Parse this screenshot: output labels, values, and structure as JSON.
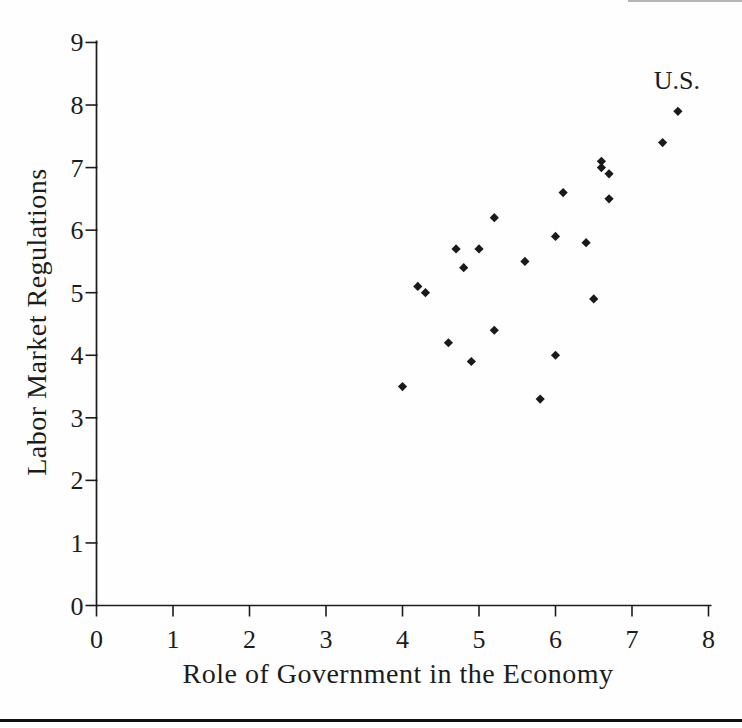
{
  "figure": {
    "background": "#fefefe",
    "ink_color": "#1c1c1c",
    "bottom_rule_color": "#101010"
  },
  "chart_data": {
    "type": "scatter",
    "title": "",
    "xlabel": "Role of Government in the Economy",
    "ylabel": "Labor Market Regulations",
    "xlim": [
      0,
      8
    ],
    "ylim": [
      0,
      9
    ],
    "xticks": [
      "0",
      "1",
      "2",
      "3",
      "4",
      "5",
      "6",
      "7",
      "8"
    ],
    "yticks": [
      "0",
      "1",
      "2",
      "3",
      "4",
      "5",
      "6",
      "7",
      "8",
      "9"
    ],
    "grid": false,
    "legend": "none",
    "marker": "diamond",
    "marker_color": "#1a1a1a",
    "points": [
      {
        "x": 7.6,
        "y": 7.9,
        "label": "U.S."
      },
      {
        "x": 7.4,
        "y": 7.4
      },
      {
        "x": 6.6,
        "y": 7.1
      },
      {
        "x": 6.6,
        "y": 7.0
      },
      {
        "x": 6.7,
        "y": 6.9
      },
      {
        "x": 6.1,
        "y": 6.6
      },
      {
        "x": 6.7,
        "y": 6.5
      },
      {
        "x": 5.2,
        "y": 6.2
      },
      {
        "x": 6.0,
        "y": 5.9
      },
      {
        "x": 6.4,
        "y": 5.8
      },
      {
        "x": 4.7,
        "y": 5.7
      },
      {
        "x": 5.0,
        "y": 5.7
      },
      {
        "x": 5.6,
        "y": 5.5
      },
      {
        "x": 4.8,
        "y": 5.4
      },
      {
        "x": 4.2,
        "y": 5.1
      },
      {
        "x": 4.3,
        "y": 5.0
      },
      {
        "x": 6.5,
        "y": 4.9
      },
      {
        "x": 5.2,
        "y": 4.4
      },
      {
        "x": 4.6,
        "y": 4.2
      },
      {
        "x": 6.0,
        "y": 4.0
      },
      {
        "x": 4.9,
        "y": 3.9
      },
      {
        "x": 4.0,
        "y": 3.5
      },
      {
        "x": 5.8,
        "y": 3.3
      }
    ],
    "annotations": [
      {
        "text": "U.S.",
        "x": 7.6,
        "y": 7.9,
        "position": "above"
      }
    ]
  }
}
